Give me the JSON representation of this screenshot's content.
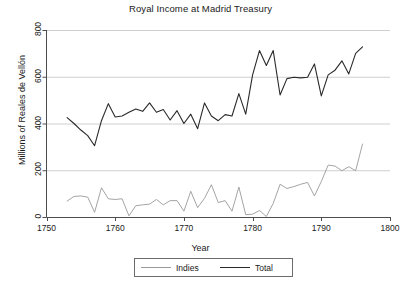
{
  "chart_data": {
    "type": "line",
    "title": "Royal Income at Madrid Treasury",
    "xlabel": "Year",
    "ylabel": "Millions of Reales de Vellón",
    "xlim": [
      1750,
      1800
    ],
    "ylim": [
      0,
      800
    ],
    "xticks": [
      1750,
      1760,
      1770,
      1780,
      1790,
      1800
    ],
    "yticks": [
      0,
      200,
      400,
      600,
      800
    ],
    "grid": "horizontal",
    "legend_position": "bottom-center",
    "x": [
      1753,
      1754,
      1755,
      1756,
      1757,
      1758,
      1759,
      1760,
      1761,
      1762,
      1763,
      1764,
      1765,
      1766,
      1767,
      1768,
      1769,
      1770,
      1771,
      1772,
      1773,
      1774,
      1775,
      1776,
      1777,
      1778,
      1779,
      1780,
      1781,
      1782,
      1783,
      1784,
      1785,
      1786,
      1787,
      1788,
      1789,
      1790,
      1791,
      1792,
      1793,
      1794,
      1795,
      1796
    ],
    "series": [
      {
        "name": "Indies",
        "color": "#9a9a9a",
        "values": [
          68,
          88,
          90,
          85,
          20,
          125,
          78,
          75,
          78,
          5,
          48,
          52,
          55,
          75,
          52,
          70,
          70,
          25,
          110,
          40,
          80,
          138,
          62,
          70,
          25,
          128,
          10,
          12,
          28,
          2,
          58,
          140,
          122,
          130,
          140,
          148,
          90,
          152,
          222,
          218,
          198,
          215,
          198,
          312
        ]
      },
      {
        "name": "Total",
        "color": "#2a2a2a",
        "values": [
          425,
          400,
          372,
          348,
          305,
          412,
          485,
          428,
          432,
          448,
          462,
          452,
          488,
          448,
          460,
          415,
          455,
          400,
          440,
          378,
          488,
          432,
          412,
          438,
          432,
          528,
          440,
          608,
          712,
          648,
          712,
          522,
          592,
          598,
          595,
          598,
          655,
          518,
          608,
          628,
          668,
          612,
          700,
          728
        ]
      }
    ]
  },
  "legend": {
    "entries": [
      {
        "label": "Indies"
      },
      {
        "label": "Total"
      }
    ]
  },
  "axes": {
    "xtick_labels": [
      "1750",
      "1760",
      "1770",
      "1780",
      "1790",
      "1800"
    ],
    "ytick_labels": [
      "0",
      "200",
      "400",
      "600",
      "800"
    ]
  }
}
